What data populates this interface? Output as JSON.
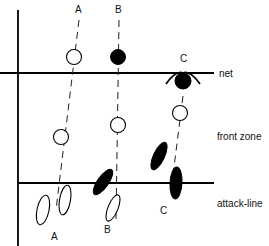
{
  "diagram": {
    "zone_labels": {
      "net": "net",
      "front_zone": "front zone",
      "attack_line": "attack-line"
    },
    "players": [
      {
        "id": "A",
        "top_label": "A",
        "bottom_label": "A",
        "net_ball": "open",
        "front_ball": "open",
        "feet": "open"
      },
      {
        "id": "B",
        "top_label": "B",
        "bottom_label": "B",
        "net_ball": "filled",
        "front_ball": "open",
        "feet": "mixed"
      },
      {
        "id": "C",
        "top_label": "C",
        "bottom_label": "C",
        "net_ball": "filled-with-arms",
        "front_ball": "open",
        "feet": "filled"
      }
    ],
    "colors": {
      "line": "#000000",
      "background": "#ffffff"
    }
  }
}
